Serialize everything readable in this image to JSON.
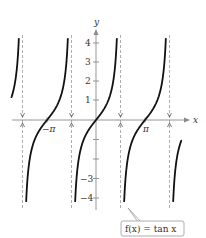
{
  "chart_data": {
    "type": "line",
    "title": "",
    "function": "f(x) = tan x",
    "xlabel": "x",
    "ylabel": "y",
    "x_ticks": [
      {
        "value": -3.14159,
        "label": "−π"
      },
      {
        "value": 3.14159,
        "label": "π"
      }
    ],
    "y_ticks": [
      {
        "value": 4,
        "label": "4"
      },
      {
        "value": 3,
        "label": "3"
      },
      {
        "value": 2,
        "label": "2"
      },
      {
        "value": 1,
        "label": "1"
      },
      {
        "value": -1,
        "label": ""
      },
      {
        "value": -2,
        "label": ""
      },
      {
        "value": -3,
        "label": "−3"
      },
      {
        "value": -4,
        "label": "−4"
      }
    ],
    "asymptotes": [
      "-3π/2",
      "-π/2",
      "π/2",
      "3π/2"
    ],
    "xlim": [
      -5.0,
      5.0
    ],
    "ylim": [
      -4.5,
      4.5
    ],
    "grid": false,
    "legend": null,
    "annotation": "f(x) = tan x",
    "colors": {
      "curve": "#111111",
      "axis": "#8a8a8a",
      "asymptote": "#9a9a9a",
      "callout_border": "#9a9a9a"
    }
  },
  "labels": {
    "x_axis": "x",
    "y_axis": "y",
    "neg_pi": "−π",
    "pi": "π",
    "y4": "4",
    "y3": "3",
    "y2": "2",
    "y1": "1",
    "yn3": "−3",
    "yn4": "−4",
    "callout": "f(x) = tan x"
  }
}
